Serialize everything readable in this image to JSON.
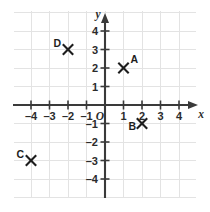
{
  "chart_data": {
    "type": "scatter",
    "title": "",
    "xlabel": "x",
    "ylabel": "y",
    "xlim": [
      -4.9,
      4.9
    ],
    "ylim": [
      -5.1,
      4.8
    ],
    "grid": true,
    "legend": "none",
    "origin_label": "O",
    "x_ticks": [
      -4,
      -3,
      -2,
      -1,
      1,
      2,
      3,
      4
    ],
    "y_ticks": [
      4,
      3,
      2,
      1,
      -1,
      -2,
      -3,
      -4
    ],
    "x_tick_labels": [
      "–4",
      "–3",
      "–2",
      "–1",
      "1",
      "2",
      "3",
      "4"
    ],
    "y_tick_labels": [
      "4",
      "3",
      "2",
      "1",
      "–1",
      "–2",
      "–3",
      "–4"
    ],
    "points": [
      {
        "label": "A",
        "x": 1,
        "y": 2,
        "label_pos": "upper-right"
      },
      {
        "label": "B",
        "x": 2,
        "y": -1,
        "label_pos": "lower-left"
      },
      {
        "label": "C",
        "x": -4,
        "y": -3,
        "label_pos": "upper-left"
      },
      {
        "label": "D",
        "x": -2,
        "y": 3,
        "label_pos": "upper-left"
      }
    ],
    "marker": "x-cross",
    "colors": {
      "grid": "#e3e3e3",
      "axis": "#3a3a3a",
      "marker": "#1d1d1d",
      "text": "#2b2b2b",
      "background": "#ffffff"
    }
  }
}
